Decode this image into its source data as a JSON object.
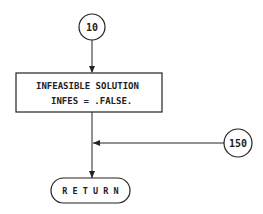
{
  "diagram": {
    "type": "flowchart",
    "nodes": {
      "start_connector": {
        "label": "10"
      },
      "process_box": {
        "line1": "INFEASIBLE SOLUTION",
        "line2": "INFES = .FALSE."
      },
      "side_connector": {
        "label": "150"
      },
      "terminator": {
        "label": "R E T U R N"
      }
    },
    "edges": [
      {
        "from": "10",
        "to": "process_box"
      },
      {
        "from": "process_box",
        "to": "RETURN"
      },
      {
        "from": "150",
        "to": "process_box-RETURN line"
      }
    ],
    "colors": {
      "stroke": "#222222",
      "background": "#ffffff"
    }
  }
}
